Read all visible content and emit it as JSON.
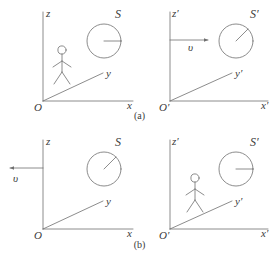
{
  "figure": {
    "captions": [
      {
        "id": "caption-a",
        "text": "(a)"
      },
      {
        "id": "caption-b",
        "text": "(b)"
      }
    ],
    "panels": [
      {
        "id": "panel-top-left",
        "frame_label": "S",
        "axes": {
          "vertical": "z",
          "diagonal": "y",
          "horizontal": "x",
          "origin": "O"
        },
        "observer_present": true,
        "clock": {
          "present": true,
          "hand_angle_deg": 0,
          "hand_direction": "right"
        },
        "velocity": {
          "present": false,
          "label": "",
          "direction": ""
        }
      },
      {
        "id": "panel-top-right",
        "frame_label": "S′",
        "axes": {
          "vertical": "z′",
          "diagonal": "y′",
          "horizontal": "x′",
          "origin": "O′"
        },
        "observer_present": false,
        "clock": {
          "present": true,
          "hand_angle_deg": 45,
          "hand_direction": "up-right"
        },
        "velocity": {
          "present": true,
          "label": "υ",
          "direction": "right"
        }
      },
      {
        "id": "panel-bottom-left",
        "frame_label": "S",
        "axes": {
          "vertical": "z",
          "diagonal": "y",
          "horizontal": "x",
          "origin": "O"
        },
        "observer_present": false,
        "clock": {
          "present": true,
          "hand_angle_deg": 45,
          "hand_direction": "up-right"
        },
        "velocity": {
          "present": true,
          "label": "υ",
          "direction": "left"
        }
      },
      {
        "id": "panel-bottom-right",
        "frame_label": "S′",
        "axes": {
          "vertical": "z′",
          "diagonal": "y′",
          "horizontal": "x′",
          "origin": "O′"
        },
        "observer_present": true,
        "clock": {
          "present": true,
          "hand_angle_deg": 0,
          "hand_direction": "right"
        },
        "velocity": {
          "present": false,
          "label": "",
          "direction": ""
        }
      }
    ],
    "colors": {
      "line": "#6f6f6f",
      "text": "#3a3a3a",
      "background": "#ffffff"
    }
  }
}
